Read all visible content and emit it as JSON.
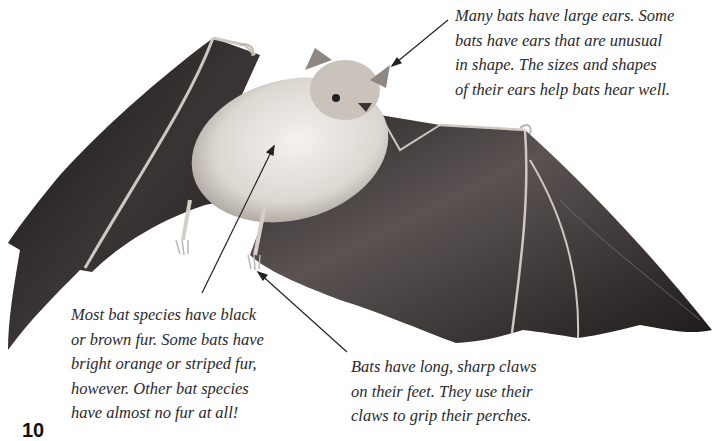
{
  "page": {
    "number": "10"
  },
  "illustration": {
    "subject": "bat with outstretched wings",
    "colors": {
      "wing": "#2b2626",
      "wing_highlight": "#6b6362",
      "fur": "#e8e4df",
      "fur_shadow": "#b9b2ab",
      "bone": "#cfc8c0"
    }
  },
  "captions": {
    "ears": {
      "lines": [
        "Many bats have large ears. Some",
        "bats have ears that are unusual",
        "in shape. The sizes and shapes",
        "of their ears help bats hear well."
      ]
    },
    "fur": {
      "lines": [
        "Most bat species have black",
        "or brown fur. Some bats have",
        "bright orange or striped fur,",
        "however. Other bat species",
        "have almost no fur at all!"
      ]
    },
    "claws": {
      "lines": [
        "Bats have long, sharp claws",
        "on their feet. They use their",
        "claws to grip their perches."
      ]
    }
  }
}
